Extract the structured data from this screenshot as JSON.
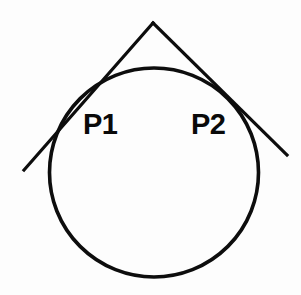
{
  "figure": {
    "background_color": "#fdfdfd",
    "stroke_color": "#0d0d0d",
    "canvas": {
      "width": 301,
      "height": 295
    },
    "circle": {
      "name": "circle",
      "cx": 154,
      "cy": 172.5,
      "r": 104.5,
      "stroke_width": 3.6
    },
    "apex": {
      "name": "external-point",
      "x": 153,
      "y": 23
    },
    "tangent_left": {
      "name": "left-tangent-line",
      "x1": 153,
      "y1": 23,
      "x2": 24,
      "y2": 170,
      "stroke_width": 3.2
    },
    "tangent_right": {
      "name": "right-tangent-line",
      "x1": 153,
      "y1": 23,
      "x2": 287,
      "y2": 155,
      "stroke_width": 3.2
    },
    "labels": {
      "p1": "P1",
      "p2": "P2"
    }
  }
}
